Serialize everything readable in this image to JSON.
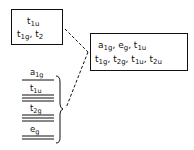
{
  "left_box": {
    "line1": [
      {
        "base": "t",
        "sub": "1u"
      }
    ],
    "line2": [
      {
        "base": "t",
        "sub": "1g"
      },
      {
        "sep": ", "
      },
      {
        "base": "t",
        "sub": "2"
      }
    ]
  },
  "right_box": {
    "line1": [
      {
        "base": "a",
        "sub": "1g"
      },
      {
        "sep": ", "
      },
      {
        "base": "e",
        "sub": "g"
      },
      {
        "sep": ", "
      },
      {
        "base": "t",
        "sub": "1u"
      }
    ],
    "line2": [
      {
        "base": "t",
        "sub": "1g"
      },
      {
        "sep": ", "
      },
      {
        "base": "t",
        "sub": "2g"
      },
      {
        "sep": ", "
      },
      {
        "base": "t",
        "sub": "1u"
      },
      {
        "sep": ", "
      },
      {
        "base": "t",
        "sub": "2u"
      }
    ]
  },
  "levels": [
    {
      "label": "a",
      "sub": "1g",
      "lines": 1
    },
    {
      "label": "t",
      "sub": "1u",
      "lines": 3
    },
    {
      "label": "t",
      "sub": "2g",
      "lines": 3
    },
    {
      "label": "e",
      "sub": "g",
      "lines": 2
    }
  ],
  "colors": {
    "ink": "#111111",
    "background": "#ffffff"
  }
}
